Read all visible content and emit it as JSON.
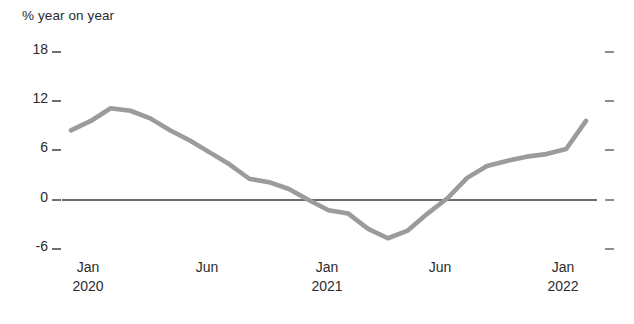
{
  "chart_data": {
    "type": "line",
    "title": "",
    "ylabel": "% year on year",
    "xlabel": "",
    "ylim": [
      -9,
      21
    ],
    "yticks": [
      18,
      12,
      6,
      0,
      -6
    ],
    "ytick_labels": [
      "18",
      "12",
      "6",
      "0",
      "-6"
    ],
    "grid": false,
    "legend": null,
    "zero_line": 0,
    "x": [
      "Oct 2019",
      "Jan 2020",
      "Feb 2020",
      "Mar 2020",
      "Apr 2020",
      "May 2020",
      "Jun 2020",
      "Jul 2020",
      "Aug 2020",
      "Sep 2020",
      "Oct 2020",
      "Nov 2020",
      "Dec 2020",
      "Jan 2021",
      "Feb 2021",
      "Mar 2021",
      "Apr 2021",
      "May 2021",
      "Jun 2021",
      "Jul 2021",
      "Aug 2021",
      "Sep 2021",
      "Oct 2021",
      "Nov 2021",
      "Dec 2021",
      "Jan 2022",
      "Mar 2022"
    ],
    "values": [
      8.2,
      9.3,
      10.8,
      10.5,
      9.6,
      8.2,
      7.0,
      5.6,
      4.2,
      2.5,
      2.1,
      1.3,
      0.0,
      -1.2,
      -1.6,
      -3.4,
      -4.5,
      -3.6,
      -1.6,
      0.2,
      2.6,
      4.0,
      4.6,
      5.1,
      5.4,
      6.0,
      9.3
    ],
    "xtick_labels": [
      {
        "month": "Jan",
        "year": "2020"
      },
      {
        "month": "Jun",
        "year": ""
      },
      {
        "month": "Jan",
        "year": "2021"
      },
      {
        "month": "Jun",
        "year": ""
      },
      {
        "month": "Jan",
        "year": "2022"
      }
    ],
    "series_color": "#9b9b9b",
    "zero_line_color": "#3a3a3a",
    "text_color": "#2b2b2b",
    "background_color": "#ffffff"
  }
}
